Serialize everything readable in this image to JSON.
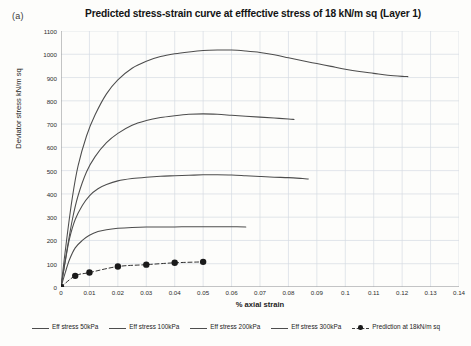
{
  "figure": {
    "panel_label": "(a)",
    "title": "Predicted stress-strain curve at efffective stress of 18 kN/m sq (Layer 1)"
  },
  "axes": {
    "ylabel": "Deviator stress kN/m sq",
    "xlabel": "% axial strain",
    "yticks": [
      "0",
      "100",
      "200",
      "300",
      "400",
      "500",
      "600",
      "700",
      "800",
      "900",
      "1000",
      "1100"
    ],
    "xticks": [
      "0",
      "0.01",
      "0.02",
      "0.03",
      "0.04",
      "0.05",
      "0.06",
      "0.07",
      "0.08",
      "0.09",
      "0.1",
      "0.11",
      "0.12",
      "0.13",
      "0.14"
    ]
  },
  "legend": {
    "items": [
      {
        "label": "Eff stress 50kPa",
        "style": "line"
      },
      {
        "label": "Eff stress 100kPa",
        "style": "line"
      },
      {
        "label": "Eff stress 200kPa",
        "style": "line"
      },
      {
        "label": "Eff stress 300kPa",
        "style": "line"
      },
      {
        "label": "Prediction at 18kN/m sq",
        "style": "marker"
      }
    ]
  },
  "chart_data": {
    "type": "line",
    "title": "Predicted stress-strain curve at efffective stress of 18 kN/m sq (Layer 1)",
    "xlabel": "% axial strain",
    "ylabel": "Deviator stress kN/m sq",
    "xlim": [
      0,
      0.14
    ],
    "ylim": [
      0,
      1100
    ],
    "xticks": [
      0,
      0.01,
      0.02,
      0.03,
      0.04,
      0.05,
      0.06,
      0.07,
      0.08,
      0.09,
      0.1,
      0.11,
      0.12,
      0.13,
      0.14
    ],
    "yticks": [
      0,
      100,
      200,
      300,
      400,
      500,
      600,
      700,
      800,
      900,
      1000,
      1100
    ],
    "grid": true,
    "legend_position": "bottom",
    "line_color": "#4d4d4d",
    "marker_color": "#1a1a1a",
    "series": [
      {
        "name": "Eff stress 50kPa",
        "style": "solid",
        "x": [
          0,
          0.0015,
          0.003,
          0.005,
          0.0075,
          0.01,
          0.013,
          0.016,
          0.02,
          0.025,
          0.03,
          0.035,
          0.04,
          0.045,
          0.05,
          0.055,
          0.06,
          0.065
        ],
        "y": [
          0,
          62,
          118,
          168,
          200,
          222,
          238,
          246,
          252,
          256,
          258,
          258,
          258,
          259,
          259,
          259,
          259,
          258
        ]
      },
      {
        "name": "Eff stress 100kPa",
        "style": "solid",
        "x": [
          0,
          0.0015,
          0.003,
          0.005,
          0.0075,
          0.01,
          0.013,
          0.016,
          0.02,
          0.025,
          0.03,
          0.035,
          0.04,
          0.045,
          0.05,
          0.055,
          0.06,
          0.065,
          0.07,
          0.075,
          0.08,
          0.085,
          0.087
        ],
        "y": [
          0,
          110,
          208,
          290,
          350,
          392,
          422,
          440,
          456,
          466,
          472,
          476,
          478,
          480,
          482,
          482,
          481,
          478,
          475,
          472,
          470,
          466,
          464
        ]
      },
      {
        "name": "Eff stress 200kPa",
        "style": "solid",
        "x": [
          0,
          0.002,
          0.004,
          0.006,
          0.009,
          0.012,
          0.016,
          0.02,
          0.025,
          0.03,
          0.035,
          0.04,
          0.045,
          0.05,
          0.055,
          0.06,
          0.065,
          0.07,
          0.075,
          0.08,
          0.082
        ],
        "y": [
          0,
          152,
          290,
          392,
          495,
          560,
          620,
          660,
          695,
          715,
          728,
          736,
          742,
          744,
          742,
          738,
          734,
          730,
          726,
          722,
          720
        ]
      },
      {
        "name": "Eff stress 300kPa",
        "style": "solid",
        "x": [
          0,
          0.002,
          0.004,
          0.006,
          0.009,
          0.012,
          0.016,
          0.02,
          0.025,
          0.03,
          0.035,
          0.04,
          0.045,
          0.05,
          0.055,
          0.06,
          0.065,
          0.07,
          0.075,
          0.08,
          0.085,
          0.09,
          0.095,
          0.1,
          0.105,
          0.11,
          0.115,
          0.12,
          0.122
        ],
        "y": [
          0,
          205,
          385,
          520,
          650,
          740,
          830,
          890,
          940,
          970,
          990,
          1002,
          1010,
          1016,
          1018,
          1018,
          1014,
          1008,
          998,
          985,
          972,
          960,
          948,
          936,
          926,
          918,
          910,
          905,
          904
        ]
      },
      {
        "name": "Prediction at 18kN/m sq",
        "style": "dashed-marker",
        "x": [
          0,
          0.005,
          0.01,
          0.02,
          0.03,
          0.04,
          0.05
        ],
        "y": [
          0,
          48,
          62,
          88,
          96,
          104,
          108
        ]
      }
    ]
  }
}
